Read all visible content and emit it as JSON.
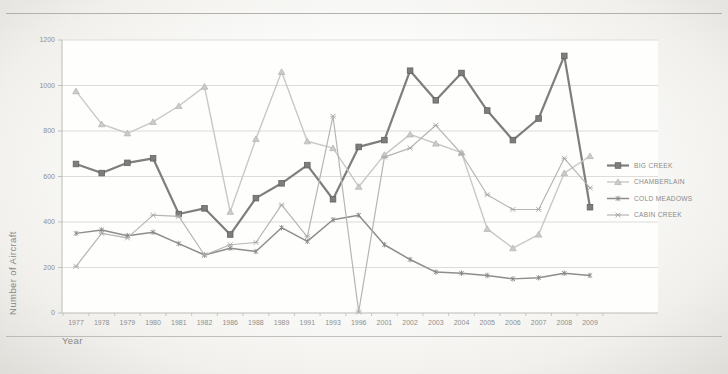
{
  "axes": {
    "y_title": "Number of Aircraft",
    "x_title": "Year"
  },
  "chart_data": {
    "type": "line",
    "title": "",
    "xlabel": "Year",
    "ylabel": "Number of Aircraft",
    "ylim": [
      0,
      1200
    ],
    "yticks": [
      0,
      200,
      400,
      600,
      800,
      1000,
      1200
    ],
    "grid": true,
    "legend_position": "right",
    "categories": [
      "1977",
      "1978",
      "1979",
      "1980",
      "1981",
      "1982",
      "1986",
      "1988",
      "1989",
      "1991",
      "1993",
      "1996",
      "2001",
      "2002",
      "2003",
      "2004",
      "2005",
      "2006",
      "2007",
      "2008",
      "2009"
    ],
    "series": [
      {
        "name": "BIG CREEK",
        "marker": "square",
        "color": "#7e7e7c",
        "marker_fill": "#7d7d7b",
        "marker_stroke": "#636361",
        "line_width": 2.2,
        "values": [
          655,
          615,
          660,
          680,
          435,
          460,
          345,
          505,
          570,
          650,
          500,
          730,
          760,
          1065,
          935,
          1055,
          890,
          760,
          855,
          1130,
          465
        ]
      },
      {
        "name": "CHAMBERLAIN",
        "marker": "triangle",
        "color": "#c8c8c5",
        "marker_fill": "#cbcbc8",
        "marker_stroke": "#b1b1ae",
        "line_width": 1.4,
        "values": [
          975,
          830,
          790,
          840,
          910,
          995,
          445,
          765,
          1060,
          755,
          725,
          555,
          695,
          785,
          745,
          705,
          370,
          285,
          345,
          615,
          690
        ]
      },
      {
        "name": "COLD MEADOWS",
        "marker": "asterisk",
        "color": "#8d8d8a",
        "marker_fill": "none",
        "marker_stroke": "#848481",
        "line_width": 1.5,
        "values": [
          350,
          365,
          340,
          355,
          305,
          255,
          285,
          270,
          375,
          315,
          410,
          430,
          300,
          235,
          180,
          175,
          165,
          150,
          155,
          175,
          165
        ]
      },
      {
        "name": "CABIN CREEK",
        "marker": "x",
        "color": "#b5b5b2",
        "marker_fill": "none",
        "marker_stroke": "#a8a8a5",
        "line_width": 1.2,
        "values": [
          205,
          350,
          330,
          430,
          425,
          255,
          300,
          310,
          475,
          335,
          865,
          5,
          685,
          725,
          825,
          700,
          520,
          455,
          455,
          680,
          550
        ]
      }
    ]
  },
  "frame": {
    "plot_bg": "#fefefd",
    "grid_color": "#d9d8d5",
    "axis_color": "#bcbbb8",
    "rule_color": "#b2b1ae"
  }
}
